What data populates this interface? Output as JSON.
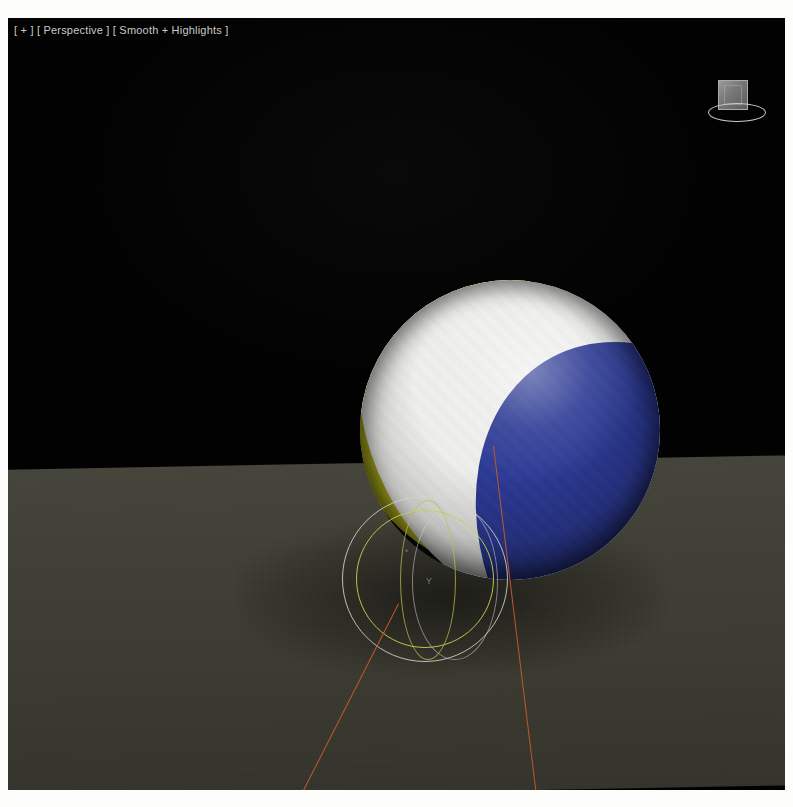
{
  "viewport": {
    "label": "[ + ] [ Perspective ] [ Smooth + Highlights ]",
    "label_parts": {
      "corner": "[ + ]",
      "view": "[ Perspective ]",
      "shading": "[ Smooth + Highlights ]"
    },
    "background_color": "#020202",
    "width": 777,
    "height": 772
  },
  "scene": {
    "objects": [
      {
        "name": "beach-ball-sphere",
        "type": "sphere",
        "panels": [
          {
            "name": "yellow-panel",
            "color": "#cfce2c"
          },
          {
            "name": "white-panel",
            "color": "#f2f2f0"
          },
          {
            "name": "blue-panel",
            "color": "#2b3996"
          }
        ],
        "center": [
          502,
          412
        ],
        "radius": 150
      },
      {
        "name": "omni-light-gizmo",
        "type": "light",
        "shape": "box-with-ring",
        "position": [
          730,
          86
        ],
        "color": "#9a9a9a"
      },
      {
        "name": "ground-plane",
        "type": "plane",
        "color": "#403f35",
        "horizon_y": 470
      }
    ],
    "gizmos": [
      {
        "name": "selection-circle-outer",
        "color": "#d3d6ce",
        "radius": 83
      },
      {
        "name": "range-circle-inner",
        "color": "#c6cf52",
        "radius": 69
      },
      {
        "name": "axis-tick-label",
        "text": "Y"
      }
    ],
    "annotation_lines": [
      {
        "name": "annotation-line-left",
        "color": "#c0582a"
      },
      {
        "name": "annotation-line-right",
        "color": "#c0582a"
      }
    ]
  },
  "colors": {
    "background": "#020202",
    "ground": "#403f35",
    "ball_yellow": "#cfce2c",
    "ball_white": "#f2f2f0",
    "ball_blue": "#2b3996",
    "gizmo_white": "#d3d6ce",
    "gizmo_green": "#c6cf52",
    "annotation_orange": "#c0582a",
    "label_text": "#c9cbc6"
  }
}
